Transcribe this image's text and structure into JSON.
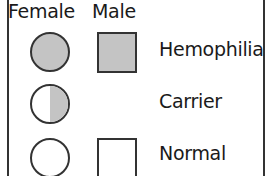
{
  "legend": {
    "headers": {
      "female": "Female",
      "male": "Male"
    },
    "rows": [
      {
        "label": "Hemophilia",
        "female_symbol": "filled-circle",
        "male_symbol": "filled-square"
      },
      {
        "label": "Carrier",
        "female_symbol": "half-filled-circle",
        "male_symbol": null
      },
      {
        "label": "Normal",
        "female_symbol": "empty-circle",
        "male_symbol": "empty-square"
      }
    ],
    "colors": {
      "fill": "#c4c4c4",
      "stroke": "#333333",
      "background": "#ffffff"
    }
  }
}
